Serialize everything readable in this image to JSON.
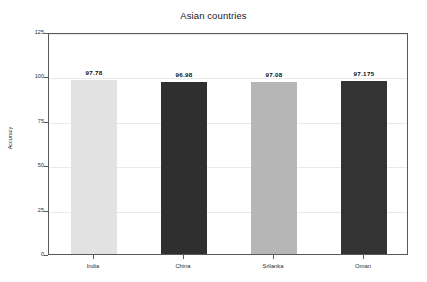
{
  "chart_data": {
    "type": "bar",
    "title": "Asian countries",
    "xlabel": "",
    "ylabel": "Accuracy",
    "categories": [
      "India",
      "China",
      "Srilanka",
      "Oman"
    ],
    "values": [
      97.78,
      96.98,
      97.08,
      97.175
    ],
    "value_labels": [
      "97.78",
      "96.98",
      "97.08",
      "97.175"
    ],
    "bar_colors": [
      "#e2e2e2",
      "#2f2f2f",
      "#b6b6b6",
      "#333333"
    ],
    "ylim": [
      0,
      125
    ],
    "yticks": [
      0,
      25,
      50,
      75,
      100,
      125
    ],
    "ytick_labels": [
      "0",
      "25",
      "50",
      "75",
      "100",
      "125"
    ],
    "grid": true,
    "grid_axis": "y",
    "legend": "none",
    "frame": true
  },
  "figure": {
    "background_color": "#ffffff",
    "axes_edge_color": "#595959",
    "grid_color": "#e9e9e9",
    "text_color": "#2b2b2b"
  }
}
